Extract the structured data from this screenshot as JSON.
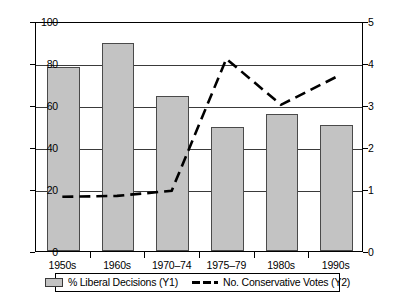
{
  "chart_data": {
    "type": "bar",
    "title": "",
    "subtitle": "",
    "xlabel": "",
    "categories": [
      "1950s",
      "1960s",
      "1970–74",
      "1975–79",
      "1980s",
      "1990s"
    ],
    "grid": true,
    "legend_position": "bottom",
    "axes": {
      "y1": {
        "label": "% Liberal Decisions (Y1)",
        "side": "left",
        "min": 0,
        "max": 100,
        "ticks": [
          0,
          20,
          40,
          60,
          80,
          100
        ],
        "tick_labels": [
          "0",
          "20",
          "40",
          "60",
          "80",
          "100"
        ]
      },
      "y2": {
        "label": "No. Conservative Votes (Y2)",
        "side": "right",
        "min": 0,
        "max": 5,
        "ticks": [
          0,
          1,
          2,
          3,
          4,
          5
        ],
        "tick_labels": [
          "0",
          "1",
          "2",
          "3",
          "4",
          "5"
        ]
      }
    },
    "series": [
      {
        "name": "% Liberal Decisions (Y1)",
        "type": "bar",
        "axis": "y1",
        "color": "#c3c3c3",
        "border_color": "#4a4a4a",
        "values": [
          80,
          90.5,
          67.5,
          54,
          59.5,
          55
        ]
      },
      {
        "name": "No. Conservative Votes (Y2)",
        "type": "line",
        "axis": "y2",
        "color": "#000000",
        "style": "dashed",
        "values": [
          1.2,
          1.22,
          1.33,
          4.2,
          3.2,
          3.8
        ]
      }
    ]
  },
  "legend": {
    "entries": [
      {
        "label": "% Liberal Decisions (Y1)",
        "marker": "bar-swatch"
      },
      {
        "label": "No. Conservative Votes (Y2)",
        "marker": "dashed-line"
      }
    ]
  }
}
